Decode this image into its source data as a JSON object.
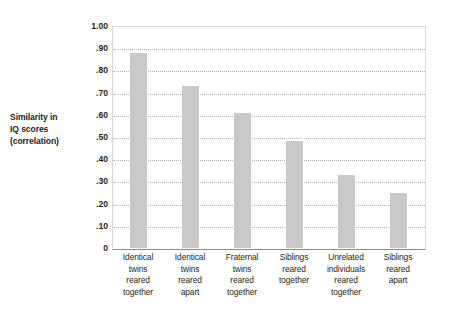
{
  "chart_data": {
    "type": "bar",
    "title": "",
    "xlabel": "",
    "ylabel": "Similarity in IQ scores (correlation)",
    "ylabel_lines": [
      "Similarity in",
      "IQ scores",
      "(correlation)"
    ],
    "ylim": [
      0,
      1.0
    ],
    "grid": true,
    "legend": "none",
    "bar_color": "#c9c9c9",
    "y_ticks": [
      {
        "value": 1.0,
        "label": "1.00"
      },
      {
        "value": 0.9,
        "label": ".90"
      },
      {
        "value": 0.8,
        "label": ".80"
      },
      {
        "value": 0.7,
        "label": ".70"
      },
      {
        "value": 0.6,
        "label": ".60"
      },
      {
        "value": 0.5,
        "label": ".50"
      },
      {
        "value": 0.4,
        "label": ".40"
      },
      {
        "value": 0.3,
        "label": ".30"
      },
      {
        "value": 0.2,
        "label": ".20"
      },
      {
        "value": 0.1,
        "label": ".10"
      },
      {
        "value": 0.0,
        "label": "0"
      }
    ],
    "categories": [
      "Identical twins reared together",
      "Identical twins reared apart",
      "Fraternal twins reared together",
      "Siblings reared together",
      "Unrelated individuals reared together",
      "Siblings reared apart"
    ],
    "category_lines": [
      [
        "Identical",
        "twins",
        "reared",
        "together"
      ],
      [
        "Identical",
        "twins",
        "reared",
        "apart"
      ],
      [
        "Fraternal",
        "twins",
        "reared",
        "together"
      ],
      [
        "Siblings",
        "reared",
        "together"
      ],
      [
        "Unrelated",
        "individuals",
        "reared",
        "together"
      ],
      [
        "Siblings",
        "reared",
        "apart"
      ]
    ],
    "values": [
      0.88,
      0.73,
      0.61,
      0.48,
      0.33,
      0.25
    ]
  }
}
